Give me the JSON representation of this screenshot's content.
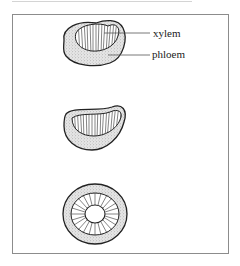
{
  "figure": {
    "frame": {
      "stroke_color": "#8c8c8c"
    },
    "labels": {
      "xylem": "xylem",
      "phloem": "phloem"
    },
    "specimens": [
      {
        "id": "top",
        "shape": "bean-shaped section",
        "labeled": true
      },
      {
        "id": "middle",
        "shape": "kidney-shaped section",
        "labeled": false
      },
      {
        "id": "bottom",
        "shape": "circular section with central pith",
        "labeled": false
      }
    ],
    "colors": {
      "outline": "#222222",
      "phloem_stipple": "#bdbdbd",
      "xylem_fill": "#ffffff"
    }
  }
}
